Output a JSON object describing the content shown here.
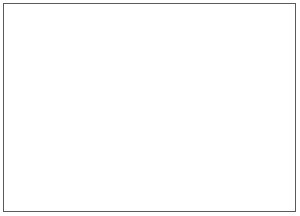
{
  "document": {
    "kind": "medical-illustration",
    "style": "grayscale pencil/airbrush anatomical rendering",
    "background_color": "#ffffff",
    "frame_color": "#5a5a5a",
    "caption": "",
    "labels": [],
    "text_present": "none"
  },
  "illustration": {
    "title": "",
    "subject": "Surgical stapling of tubular structures beneath a rounded anatomical mass",
    "palette": {
      "white": "#ffffff",
      "light_gray": "#e8e8e8",
      "mid_gray": "#b5b5b5",
      "shadow_gray": "#8a8a8a",
      "dark_gray": "#5f5f5f",
      "outline": "#6b6b6b",
      "staple_dot": "#2b2b2b",
      "blade": "#4a4a4a"
    },
    "parts": [
      {
        "name": "cranial-mass",
        "label": "rounded anatomical dome",
        "description": "large shaded bulbous structure occupying the upper-left center"
      },
      {
        "name": "lobed-lesion",
        "label": "lobed lesion",
        "description": "two-lobed outlined nodule on the lower right face of the dome"
      },
      {
        "name": "curved-limb",
        "label": "curved tubular limb",
        "description": "tube sweeping from the lesion toward the upper right"
      },
      {
        "name": "tube-bundle",
        "label": "parallel tubular structures",
        "count": 4,
        "description": "four cylindrical rods running from upper-left down to lower-right"
      },
      {
        "name": "staple-line",
        "label": "staple / perforation row",
        "dot_count": 17,
        "description": "row of small dark square staples along the uppermost tube"
      },
      {
        "name": "cutting-blade",
        "label": "vertical cutting blade",
        "description": "narrow blade crossing the tube bundle vertically, tapering to a point"
      },
      {
        "name": "suture-thread",
        "label": "wavy suture thread",
        "count": 2,
        "description": "two squiggly thin lines over the soft tissue at lower left"
      },
      {
        "name": "soft-tissue",
        "label": "soft tissue field",
        "description": "pale shaded tissue mass at the lower left"
      }
    ]
  }
}
